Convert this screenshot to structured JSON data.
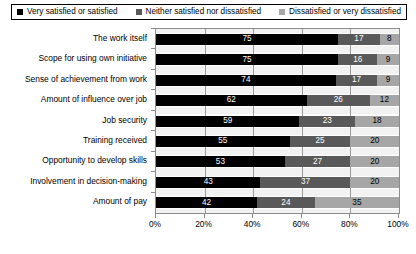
{
  "chart_data": {
    "type": "bar",
    "orientation": "horizontal",
    "stacked": true,
    "stacked_100": true,
    "title": "",
    "xlabel": "",
    "ylabel": "",
    "xlim": [
      0,
      100
    ],
    "grid": true,
    "legend_position": "top",
    "xticks": [
      "0%",
      "20%",
      "40%",
      "60%",
      "80%",
      "100%"
    ],
    "xtick_values": [
      0,
      20,
      40,
      60,
      80,
      100
    ],
    "categories": [
      "The work itself",
      "Scope for using own initiative",
      "Sense of achievement from work",
      "Amount of influence over job",
      "Job security",
      "Training received",
      "Opportunity to develop skills",
      "Involvement in decision-making",
      "Amount of pay"
    ],
    "series": [
      {
        "name": "Very satisfied or satisfied",
        "color": "#000000",
        "values": [
          75,
          75,
          74,
          62,
          59,
          55,
          53,
          43,
          42
        ]
      },
      {
        "name": "Neither satisfied nor dissatisfied",
        "color": "#595959",
        "values": [
          17,
          16,
          17,
          26,
          23,
          25,
          27,
          37,
          24
        ]
      },
      {
        "name": "Dissatisfied or very dissatisfied",
        "color": "#a6a6a6",
        "values": [
          8,
          9,
          9,
          12,
          18,
          20,
          20,
          20,
          35
        ]
      }
    ]
  },
  "legend": {
    "items": [
      {
        "label": "Very satisfied or satisfied",
        "color": "#000000"
      },
      {
        "label": "Neither satisfied nor dissatisfied",
        "color": "#595959"
      },
      {
        "label": "Dissatisfied or very dissatisfied",
        "color": "#a6a6a6"
      }
    ]
  },
  "colors": {
    "plot_background": "#f2f2f2",
    "band_background": "#ffffff",
    "axis_line": "#8c8c8c",
    "gridline": "#9a9a9a",
    "text": "#000000"
  }
}
